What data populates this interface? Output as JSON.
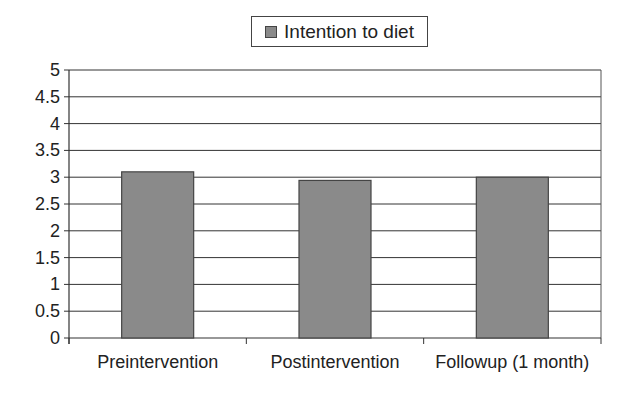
{
  "chart_data": {
    "type": "bar",
    "title": "",
    "xlabel": "",
    "ylabel": "",
    "categories": [
      "Preintervention",
      "Postintervention",
      "Followup (1 month)"
    ],
    "series": [
      {
        "name": "Intention to diet",
        "values": [
          3.1,
          2.94,
          3.0
        ],
        "color": "#8a8a8a"
      }
    ],
    "ylim": [
      0,
      5
    ],
    "yticks": [
      "0",
      "0.5",
      "1",
      "1.5",
      "2",
      "2.5",
      "3",
      "3.5",
      "4",
      "4.5",
      "5"
    ],
    "grid": true,
    "legend_position": "top"
  },
  "legend": {
    "label": "Intention to diet"
  }
}
